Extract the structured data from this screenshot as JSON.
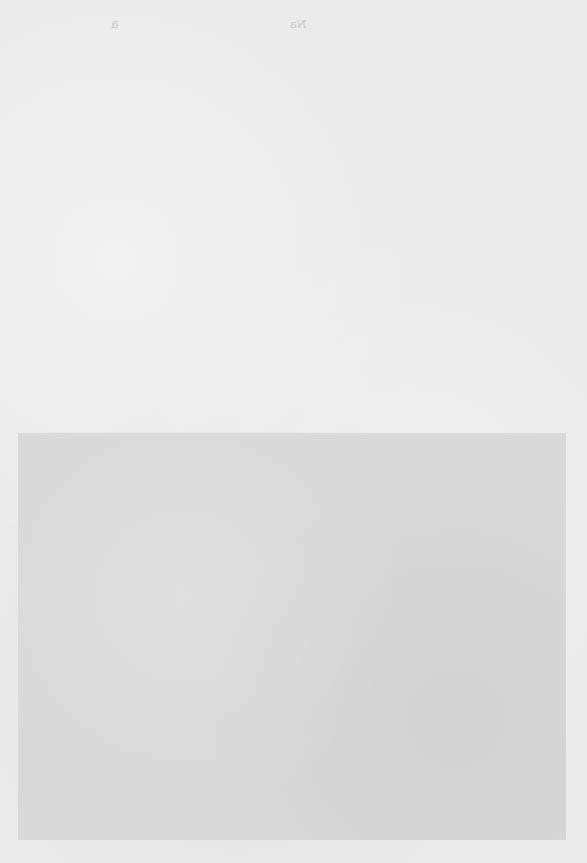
{
  "page": {
    "bleed_through_text": [
      "a",
      "Na"
    ],
    "image_plate": {
      "content": ""
    }
  }
}
